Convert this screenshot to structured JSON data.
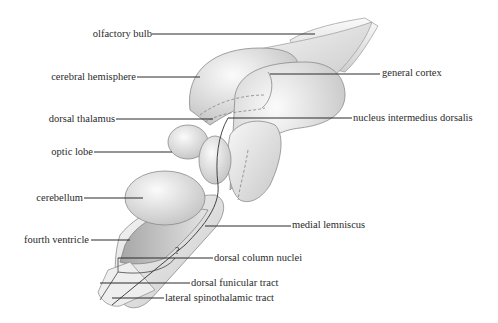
{
  "diagram": {
    "colors": {
      "background": "#ffffff",
      "tissue_light": "#f4f4f4",
      "tissue_mid": "#d9d9d9",
      "tissue_dark": "#a9a9a9",
      "outline": "#8a8a8a",
      "leader": "#2a2a2a",
      "text": "#2a2a2a"
    },
    "question_mark": "?",
    "labels": {
      "olfactory_bulb": "olfactory bulb",
      "cerebral_hemisphere": "cerebral hemisphere",
      "dorsal_thalamus": "dorsal thalamus",
      "optic_lobe": "optic lobe",
      "cerebellum": "cerebellum",
      "fourth_ventricle": "fourth ventricle",
      "general_cortex": "general cortex",
      "nucleus_intermedius_dorsalis": "nucleus intermedius dorsalis",
      "medial_lemniscus": "medial lemniscus",
      "dorsal_column_nuclei": "dorsal column nuclei",
      "dorsal_funicular_tract": "dorsal funicular tract",
      "lateral_spinothalamic_tract": "lateral spinothalamic tract"
    }
  }
}
